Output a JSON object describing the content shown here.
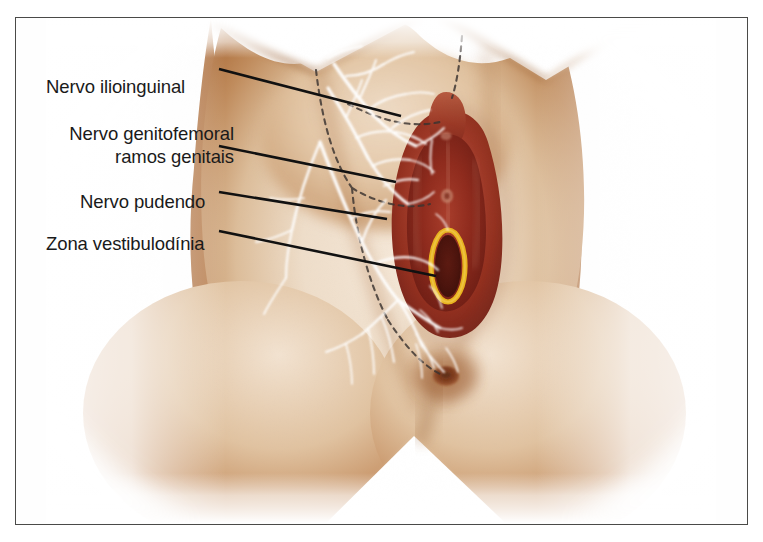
{
  "figure": {
    "type": "medical-anatomical-illustration",
    "language": "pt-BR",
    "frame": {
      "border_color": "#4a4a48",
      "background": "#ffffff"
    }
  },
  "labels": [
    {
      "id": "ilioinguinal",
      "text": "Nervo ilioinguinal",
      "lines": [
        "Nervo ilioinguinal"
      ],
      "align": "left"
    },
    {
      "id": "genitofemoral",
      "text": "Nervo genitofemoral ramos genitais",
      "line1": "Nervo genitofemoral",
      "line2": "ramos genitais",
      "align": "right"
    },
    {
      "id": "pudendo",
      "text": "Nervo pudendo",
      "lines": [
        "Nervo pudendo"
      ],
      "align": "left"
    },
    {
      "id": "vestibulodinia",
      "text": "Zona vestibulodínia",
      "lines": [
        "Zona vestibulodínia"
      ],
      "align": "left"
    }
  ],
  "anatomy": {
    "regions": [
      "coxa esquerda",
      "coxa direita",
      "monte púbico",
      "lábios maiores",
      "lábios menores",
      "vestíbulo vaginal",
      "períneo",
      "ânus"
    ],
    "nerve_network_color": "#ffffff",
    "dermatome_boundary_style": "dashed",
    "dermatome_boundary_color": "#3a3330",
    "vestibulodynia_ring_color": "#e8b31e",
    "vestibulodynia_ring_shape": "oval",
    "leader_line_color": "#111111"
  },
  "colors": {
    "skin_light": "#f3e3d2",
    "skin_mid": "#e0c3a4",
    "skin_tan": "#c89265",
    "skin_deep": "#a96a39",
    "skin_shadow": "#8f5529",
    "vulva_red": "#a4392a",
    "vulva_dark": "#6e2118",
    "vulva_mid": "#b4513a",
    "vulva_light": "#c8705a",
    "introitus": "#5a1a12",
    "ring_yellow": "#e8b31e",
    "label_text": "#1a1a1a",
    "frame": "#4a4a48",
    "background": "#ffffff"
  }
}
